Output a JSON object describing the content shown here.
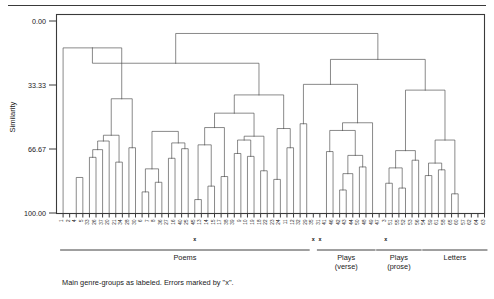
{
  "figure": {
    "caption": "Main genre-groups as labeled. Errors marked by \"x\".",
    "axis_title": "Similarity"
  },
  "chart_data": {
    "type": "dendrogram",
    "title": "",
    "subtitle": "",
    "xlabel": "",
    "ylabel": "Similarity",
    "ylim": [
      0.0,
      100.0
    ],
    "y_inverted": true,
    "grid": false,
    "legend_position": "none",
    "tick_labels": [
      "0.00",
      "33.33",
      "66.67",
      "100.00"
    ],
    "tick_values": [
      0.0,
      33.33,
      66.67,
      100.0
    ],
    "leaf_count": 64,
    "leaf_labels": [
      "1",
      "2",
      "4",
      "5",
      "33",
      "26",
      "37",
      "20",
      "21",
      "34",
      "28",
      "30",
      "6",
      "7",
      "8",
      "36",
      "27",
      "16",
      "40",
      "25",
      "45",
      "13",
      "14",
      "15",
      "17",
      "38",
      "39",
      "9",
      "10",
      "19",
      "18",
      "22",
      "23",
      "24",
      "11",
      "12",
      "32",
      "29",
      "35",
      "31",
      "41",
      "46",
      "42",
      "43",
      "44",
      "50",
      "48",
      "49",
      "47",
      "3",
      "51",
      "55",
      "52",
      "53",
      "56",
      "54",
      "59",
      "61",
      "58",
      "65",
      "60",
      "57",
      "62",
      "64",
      "63"
    ],
    "error_marks": [
      {
        "label": "x",
        "leaf_index": 20
      },
      {
        "label": "x",
        "leaf_index": 38
      },
      {
        "label": "x",
        "leaf_index": 39
      },
      {
        "label": "x",
        "leaf_index": 49
      }
    ],
    "group_brackets": [
      {
        "name": "Poems",
        "label_lines": [
          "Poems"
        ],
        "start_leaf": 0,
        "end_leaf": 37
      },
      {
        "name": "Plays (verse)",
        "label_lines": [
          "Plays",
          "(verse)"
        ],
        "start_leaf": 39,
        "end_leaf": 47
      },
      {
        "name": "Plays (prose)",
        "label_lines": [
          "Plays",
          "(prose)"
        ],
        "start_leaf": 48,
        "end_leaf": 54
      },
      {
        "name": "Letters",
        "label_lines": [
          "Letters"
        ],
        "start_leaf": 55,
        "end_leaf": 64
      }
    ],
    "merges": [
      {
        "left": "L2",
        "right": "L3",
        "height": 81.5
      },
      {
        "left": "L4",
        "right": "L5",
        "height": 71.0
      },
      {
        "left": "M1",
        "right": "L6",
        "height": 67.0
      },
      {
        "left": "M2",
        "right": "L7",
        "height": 62.5
      },
      {
        "left": "L8",
        "right": "L9",
        "height": 73.5
      },
      {
        "left": "M4",
        "right": "M3",
        "height": 59.5
      },
      {
        "left": "L10",
        "right": "L11",
        "height": 66.0
      },
      {
        "left": "M6",
        "right": "M5",
        "height": 40.5
      },
      {
        "left": "L0",
        "right": "M7",
        "height": 14.0
      },
      {
        "left": "L12",
        "right": "L13",
        "height": 89.0
      },
      {
        "left": "L14",
        "right": "L15",
        "height": 84.0
      },
      {
        "left": "M9",
        "right": "M10",
        "height": 77.0
      },
      {
        "left": "L16",
        "right": "L17",
        "height": 71.5
      },
      {
        "left": "L18",
        "right": "L19",
        "height": 66.5
      },
      {
        "left": "M12",
        "right": "M13",
        "height": 63.5
      },
      {
        "left": "M11",
        "right": "M14",
        "height": 57.5
      },
      {
        "left": "L20",
        "right": "L21",
        "height": 93.0
      },
      {
        "left": "L22",
        "right": "L23",
        "height": 86.0
      },
      {
        "left": "M16",
        "right": "M17",
        "height": 64.5
      },
      {
        "left": "L24",
        "right": "L25",
        "height": 81.0
      },
      {
        "left": "M18",
        "right": "M19",
        "height": 55.5
      },
      {
        "left": "L26",
        "right": "L27",
        "height": 69.0
      },
      {
        "left": "L28",
        "right": "L29",
        "height": 70.5
      },
      {
        "left": "M21",
        "right": "M22",
        "height": 62.0
      },
      {
        "left": "L30",
        "right": "L31",
        "height": 78.0
      },
      {
        "left": "M23",
        "right": "M24",
        "height": 60.0
      },
      {
        "left": "M20",
        "right": "M25",
        "height": 48.0
      },
      {
        "left": "L32",
        "right": "L33",
        "height": 82.5
      },
      {
        "left": "L34",
        "right": "L35",
        "height": 66.0
      },
      {
        "left": "M27",
        "right": "M28",
        "height": 56.0
      },
      {
        "left": "M26",
        "right": "M29",
        "height": 38.5
      },
      {
        "left": "M8",
        "right": "M30",
        "height": 22.0
      },
      {
        "left": "L36",
        "right": "L37",
        "height": 53.5
      },
      {
        "left": "L40",
        "right": "L41",
        "height": 68.0
      },
      {
        "left": "L42",
        "right": "L43",
        "height": 88.0
      },
      {
        "left": "M34",
        "right": "L44",
        "height": 79.5
      },
      {
        "left": "L45",
        "right": "L46",
        "height": 76.0
      },
      {
        "left": "M35",
        "right": "M36",
        "height": 70.0
      },
      {
        "left": "M33",
        "right": "M37",
        "height": 57.0
      },
      {
        "left": "M38",
        "right": "L47",
        "height": 53.0
      },
      {
        "left": "M39",
        "right": "M32",
        "height": 33.0
      },
      {
        "left": "L49",
        "right": "L50",
        "height": 84.5
      },
      {
        "left": "L51",
        "right": "L52",
        "height": 87.0
      },
      {
        "left": "M41",
        "right": "M42",
        "height": 76.5
      },
      {
        "left": "L53",
        "right": "L54",
        "height": 72.5
      },
      {
        "left": "M43",
        "right": "M44",
        "height": 67.5
      },
      {
        "left": "L55",
        "right": "L56",
        "height": 80.5
      },
      {
        "left": "L57",
        "right": "L58",
        "height": 77.5
      },
      {
        "left": "M46",
        "right": "M47",
        "height": 74.0
      },
      {
        "left": "L59",
        "right": "L60",
        "height": 90.0
      },
      {
        "left": "M48",
        "right": "M49",
        "height": 62.0
      },
      {
        "left": "M45",
        "right": "M50",
        "height": 36.0
      },
      {
        "left": "M40",
        "right": "M51",
        "height": 20.0
      },
      {
        "left": "M31",
        "right": "M52",
        "height": 6.5
      }
    ]
  }
}
